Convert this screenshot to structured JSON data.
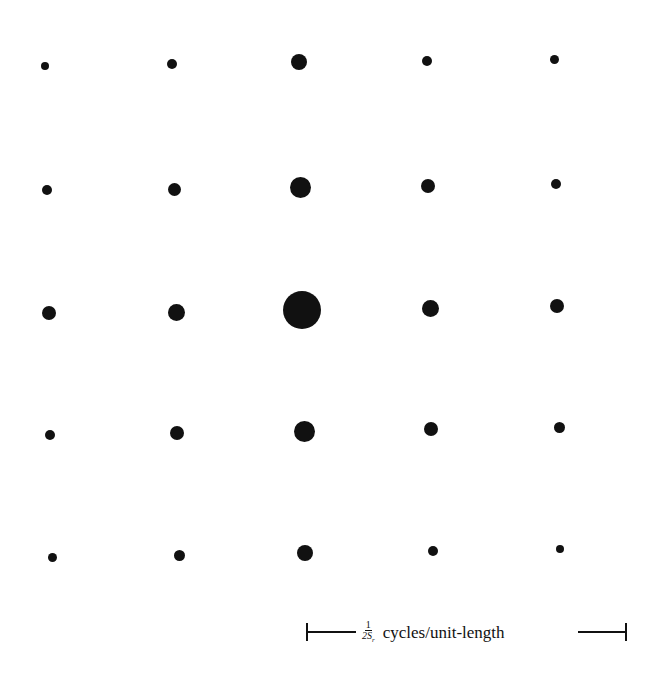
{
  "figure": {
    "scale_bar": {
      "fraction_numerator": "1",
      "fraction_denominator": "2S",
      "fraction_subscript": "r",
      "label": "cycles/unit-length"
    },
    "dot_color": "#111111",
    "grid": [
      [
        {
          "x": 45,
          "y": 66,
          "r": 4
        },
        {
          "x": 172,
          "y": 64,
          "r": 5
        },
        {
          "x": 299,
          "y": 62,
          "r": 8
        },
        {
          "x": 427,
          "y": 61,
          "r": 5
        },
        {
          "x": 554,
          "y": 59,
          "r": 4.5
        }
      ],
      [
        {
          "x": 47,
          "y": 190,
          "r": 5
        },
        {
          "x": 174,
          "y": 189,
          "r": 6.5
        },
        {
          "x": 300,
          "y": 187,
          "r": 10.5
        },
        {
          "x": 428,
          "y": 186,
          "r": 7
        },
        {
          "x": 556,
          "y": 184,
          "r": 5
        }
      ],
      [
        {
          "x": 49,
          "y": 313,
          "r": 7
        },
        {
          "x": 176,
          "y": 312,
          "r": 8.5
        },
        {
          "x": 302,
          "y": 310,
          "r": 19
        },
        {
          "x": 430,
          "y": 308,
          "r": 8.5
        },
        {
          "x": 557,
          "y": 306,
          "r": 7
        }
      ],
      [
        {
          "x": 50,
          "y": 435,
          "r": 5
        },
        {
          "x": 177,
          "y": 433,
          "r": 7
        },
        {
          "x": 304,
          "y": 431,
          "r": 10.5
        },
        {
          "x": 431,
          "y": 429,
          "r": 7
        },
        {
          "x": 559,
          "y": 427,
          "r": 5.5
        }
      ],
      [
        {
          "x": 52,
          "y": 557,
          "r": 4.5
        },
        {
          "x": 179,
          "y": 555,
          "r": 5.5
        },
        {
          "x": 305,
          "y": 553,
          "r": 8
        },
        {
          "x": 433,
          "y": 551,
          "r": 5
        },
        {
          "x": 560,
          "y": 549,
          "r": 4
        }
      ]
    ]
  }
}
